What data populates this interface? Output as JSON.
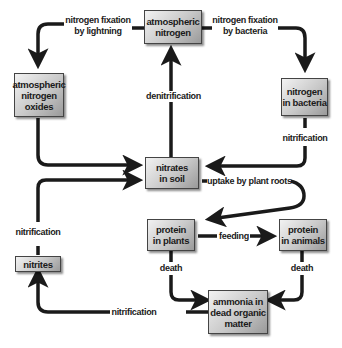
{
  "diagram": {
    "type": "nitrogen-cycle",
    "nodes": {
      "atmospheric_nitrogen": "atmospheric nitrogen",
      "atmospheric_nitrogen_oxides": "atmospheric nitrogen oxides",
      "nitrogen_in_bacteria": "nitrogen in bacteria",
      "nitrates_in_soil": "nitrates in soil",
      "nitrites": "nitrites",
      "protein_in_plants": "protein in plants",
      "protein_in_animals": "protein in animals",
      "ammonia_in_dead_organic_matter": "ammonia in dead organic matter"
    },
    "node_lines": {
      "atmospheric_nitrogen": [
        "atmospheric",
        "nitrogen"
      ],
      "atmospheric_nitrogen_oxides": [
        "atmospheric",
        "nitrogen",
        "oxides"
      ],
      "nitrogen_in_bacteria": [
        "nitrogen",
        "in bacteria"
      ],
      "nitrates_in_soil": [
        "nitrates",
        "in soil"
      ],
      "nitrites": [
        "nitrites"
      ],
      "protein_in_plants": [
        "protein",
        "in plants"
      ],
      "protein_in_animals": [
        "protein",
        "in animals"
      ],
      "ammonia_in_dead_organic_matter": [
        "ammonia in",
        "dead organic",
        "matter"
      ]
    },
    "edges": [
      {
        "from": "atmospheric nitrogen",
        "to": "atmospheric nitrogen oxides",
        "label": [
          "nitrogen fixation",
          "by lightning"
        ]
      },
      {
        "from": "atmospheric nitrogen",
        "to": "nitrogen in bacteria",
        "label": [
          "nitrogen fixation",
          "by bacteria"
        ]
      },
      {
        "from": "nitrates in soil",
        "to": "atmospheric nitrogen",
        "label": [
          "denitrification"
        ]
      },
      {
        "from": "atmospheric nitrogen oxides",
        "to": "nitrates in soil",
        "label": []
      },
      {
        "from": "nitrogen in bacteria",
        "to": "nitrates in soil",
        "label": [
          "nitrification"
        ]
      },
      {
        "from": "nitrites",
        "to": "nitrates in soil",
        "label": [
          "nitrification"
        ]
      },
      {
        "from": "nitrates in soil",
        "to": "protein in plants",
        "label": [
          "uptake by plant roots"
        ]
      },
      {
        "from": "protein in plants",
        "to": "protein in animals",
        "label": [
          "feeding"
        ]
      },
      {
        "from": "protein in plants",
        "to": "ammonia in dead organic matter",
        "label": [
          "death"
        ]
      },
      {
        "from": "protein in animals",
        "to": "ammonia in dead organic matter",
        "label": [
          "death"
        ]
      },
      {
        "from": "ammonia in dead organic matter",
        "to": "nitrites",
        "label": [
          "nitrification"
        ]
      }
    ],
    "labels": {
      "fix_lightning": [
        "nitrogen fixation",
        "by lightning"
      ],
      "fix_bacteria": [
        "nitrogen fixation",
        "by bacteria"
      ],
      "denitrification": "denitrification",
      "nitrification_bacteria": "nitrification",
      "nitrification_nitrites": "nitrification",
      "uptake": "uptake by plant roots",
      "feeding": "feeding",
      "death_plants": "death",
      "death_animals": "death",
      "nitrification_ammonia": "nitrification"
    },
    "colors": {
      "arrow": "#1a1a1a",
      "box_light": "#f2f2f2",
      "box_dark": "#9a9a9a",
      "background": "#ffffff"
    }
  }
}
